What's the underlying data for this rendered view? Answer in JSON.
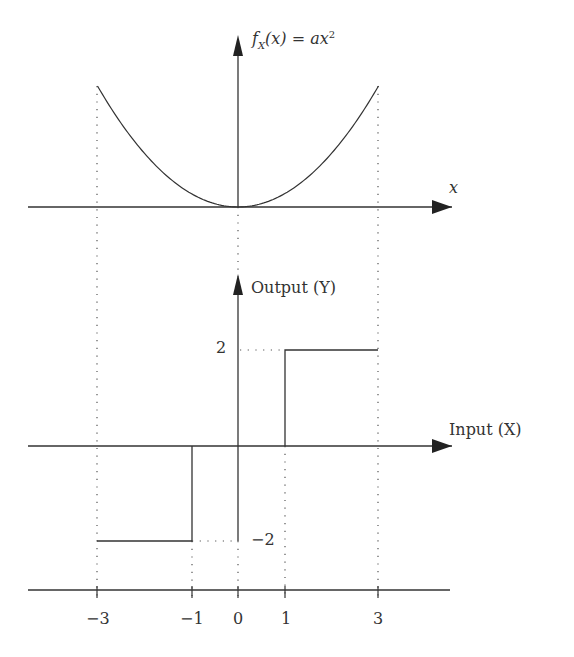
{
  "top_plot": {
    "y_axis_label": {
      "func": "f",
      "sub": "X",
      "arg": "(x)",
      "eq": " = ax",
      "sup": "2"
    },
    "x_axis_label": "x",
    "curve": "parabola f_X(x) = a x^2 on [-3, 3]"
  },
  "bottom_plot": {
    "y_axis_label": "Output (Y)",
    "x_axis_label": "Input (X)",
    "y_ticks": [
      "2",
      "−2"
    ],
    "steps": [
      {
        "from": -3,
        "to": -1,
        "y": -2
      },
      {
        "from": -1,
        "to": 1,
        "y": 0
      },
      {
        "from": 1,
        "to": 3,
        "y": 2
      }
    ]
  },
  "shared_x_ticks": [
    "−3",
    "−1",
    "0",
    "1",
    "3"
  ],
  "colors": {
    "line": "#333333",
    "dotted": "#555555"
  }
}
